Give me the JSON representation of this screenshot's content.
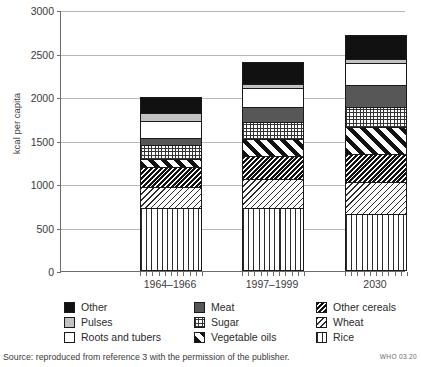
{
  "chart_data": {
    "type": "bar",
    "stacked": true,
    "title": "",
    "xlabel": "",
    "ylabel": "kcal per capita",
    "ylim": [
      0,
      3000
    ],
    "yticks": [
      0,
      500,
      1000,
      1500,
      2000,
      2500,
      3000
    ],
    "grid": true,
    "legend_position": "bottom",
    "categories": [
      "1964–1966",
      "1997–1999",
      "2030"
    ],
    "totals": [
      2000,
      2600,
      2850
    ],
    "series": [
      {
        "name": "Rice",
        "pattern": "vertical-lines",
        "values": [
          720,
          725,
          650
        ]
      },
      {
        "name": "Wheat",
        "pattern": "light-diagonal",
        "values": [
          250,
          330,
          370
        ]
      },
      {
        "name": "Other cereals",
        "pattern": "dense-dark-diagonal",
        "values": [
          230,
          265,
          320
        ]
      },
      {
        "name": "Vegetable oils",
        "pattern": "wide-diagonal",
        "values": [
          90,
          195,
          310
        ]
      },
      {
        "name": "Sugar",
        "pattern": "grid-dots",
        "values": [
          160,
          200,
          230
        ]
      },
      {
        "name": "Meat",
        "pattern": "dark-grey-solid",
        "values": [
          80,
          175,
          255
        ]
      },
      {
        "name": "Roots and tubers",
        "pattern": "white-solid",
        "values": [
          190,
          210,
          260
        ]
      },
      {
        "name": "Pulses",
        "pattern": "light-grey-solid",
        "values": [
          100,
          45,
          40
        ]
      },
      {
        "name": "Other",
        "pattern": "black-solid",
        "values": [
          180,
          255,
          280
        ]
      }
    ]
  },
  "legend": {
    "items": [
      {
        "label": "Other",
        "key": "other"
      },
      {
        "label": "Meat",
        "key": "meat"
      },
      {
        "label": "Other cereals",
        "key": "othercereals"
      },
      {
        "label": "Pulses",
        "key": "pulses"
      },
      {
        "label": "Sugar",
        "key": "sugar"
      },
      {
        "label": "Wheat",
        "key": "wheat"
      },
      {
        "label": "Roots and tubers",
        "key": "roots"
      },
      {
        "label": "Vegetable oils",
        "key": "vegoils"
      },
      {
        "label": "Rice",
        "key": "rice"
      }
    ]
  },
  "footer": {
    "source": "Source: reproduced from reference 3 with the permission of the publisher.",
    "who_code": "WHO 03.20"
  },
  "colors": {
    "axis": "#6d6d6d",
    "grid": "#b9b9b9",
    "text": "#2a2a2a",
    "black_fill": "#111111",
    "meat_fill": "#575757",
    "pulses_fill": "#c2c2c2"
  }
}
